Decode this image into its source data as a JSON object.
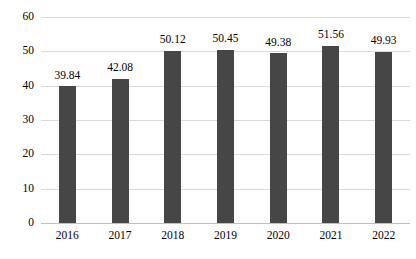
{
  "chart_data": {
    "type": "bar",
    "title": "",
    "subtitle": "",
    "xlabel": "",
    "ylabel": "",
    "categories": [
      "2016",
      "2017",
      "2018",
      "2019",
      "2020",
      "2021",
      "2022"
    ],
    "values": [
      39.84,
      42.08,
      50.12,
      50.45,
      49.38,
      51.56,
      49.93
    ],
    "data_labels": [
      "39.84",
      "42.08",
      "50.12",
      "50.45",
      "49.38",
      "51.56",
      "49.93"
    ],
    "ylim": [
      0,
      60
    ],
    "y_ticks": [
      0,
      10,
      20,
      30,
      40,
      50,
      60
    ],
    "y_tick_labels": [
      "0",
      "10",
      "20",
      "30",
      "40",
      "50",
      "60"
    ],
    "grid": true,
    "grid_axis": "y",
    "legend": false,
    "legend_position": "none",
    "series": [
      {
        "name": "",
        "values": [
          39.84,
          42.08,
          50.12,
          50.45,
          49.38,
          51.56,
          49.93
        ]
      }
    ],
    "colors": {
      "bar": "#464646",
      "gridline": "#d9d9d9",
      "baseline": "#bfbfbf",
      "background": "#ffffff",
      "text": "#000000"
    }
  }
}
